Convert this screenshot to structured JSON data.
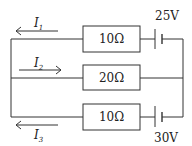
{
  "diagram": {
    "type": "circuit",
    "branches": [
      {
        "id": "top",
        "resistor": "10Ω",
        "battery": "25V",
        "current": {
          "symbol": "I",
          "sub": "1",
          "direction": "left"
        }
      },
      {
        "id": "middle",
        "resistor": "20Ω",
        "battery": null,
        "current": {
          "symbol": "I",
          "sub": "2",
          "direction": "right"
        }
      },
      {
        "id": "bottom",
        "resistor": "10Ω",
        "battery": "30V",
        "current": {
          "symbol": "I",
          "sub": "3",
          "direction": "left"
        }
      }
    ]
  }
}
